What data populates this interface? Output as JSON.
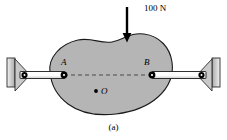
{
  "figure": {
    "caption": "(a)",
    "labels": {
      "load": "100 N",
      "point_a": "A",
      "point_b": "B",
      "point_o": "O"
    },
    "colors": {
      "body_fill": "#b5b5b5",
      "body_stroke": "#1a1a1a",
      "link_fill": "#ffffff",
      "link_stroke": "#1a1a1a",
      "support_fill": "#c8c8c8",
      "support_stroke": "#1a1a1a",
      "pin_fill": "#000000",
      "dash_stroke": "#555555",
      "arrow_stroke": "#000000",
      "background": "#ffffff"
    },
    "geometry": {
      "load_arrow": {
        "x": 127,
        "y_start": 7,
        "y_end": 41
      },
      "point_a": {
        "x": 64,
        "y": 75
      },
      "point_b": {
        "x": 152,
        "y": 75
      },
      "point_o": {
        "x": 96,
        "y": 91
      },
      "left_support_wall": {
        "x": 7,
        "y": 59,
        "w": 8,
        "h": 28
      },
      "right_support_wall": {
        "x": 212,
        "y": 59,
        "w": 8,
        "h": 28
      },
      "left_link": {
        "x1": 21,
        "x2": 64,
        "y": 75
      },
      "right_link": {
        "x1": 152,
        "x2": 206,
        "y": 75
      }
    },
    "elements": {
      "rigid_body": "irregular-blob-plate",
      "load": "downward-point-load",
      "dashed_line": "line-of-action-AB",
      "left_link": "two-force-member-link",
      "right_link": "two-force-member-link",
      "left_support": "pin-support-on-wall",
      "right_support": "pin-support-on-wall"
    }
  }
}
